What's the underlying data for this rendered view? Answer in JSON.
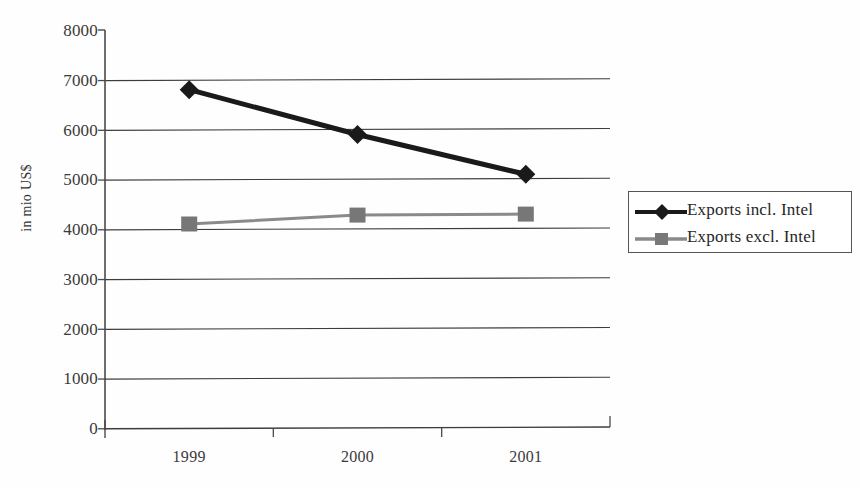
{
  "chart_data": {
    "type": "line",
    "title": "",
    "subtitle": "",
    "xlabel": "",
    "ylabel": "in mio US$",
    "categories": [
      "1999",
      "2000",
      "2001"
    ],
    "ylim": [
      0,
      8000
    ],
    "y_ticks": [
      8000,
      7000,
      6000,
      5000,
      4000,
      3000,
      2000,
      1000,
      0
    ],
    "grid": true,
    "grid_axis": "y",
    "legend_position": "right",
    "series": [
      {
        "name": "Exports incl. Intel",
        "values": [
          6800,
          5900,
          5100
        ],
        "color": "#1a1a1a",
        "marker": "diamond"
      },
      {
        "name": "Exports excl. Intel",
        "values": [
          4100,
          4280,
          4300
        ],
        "color": "#777777",
        "marker": "square"
      }
    ]
  },
  "legend": {
    "items": [
      {
        "label": "Exports incl. Intel"
      },
      {
        "label": "Exports excl. Intel"
      }
    ]
  },
  "colors": {
    "series_incl_intel": "#1a1a1a",
    "series_excl_intel": "#777777",
    "axis": "#4a4a4a",
    "gridline": "#3d3d3d",
    "background": "#fefefe"
  }
}
